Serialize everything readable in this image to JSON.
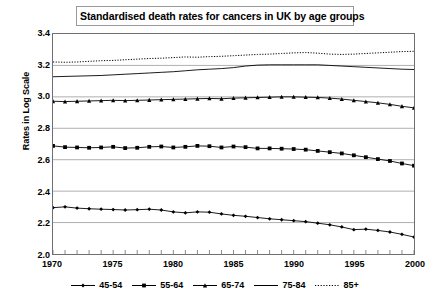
{
  "chart_data": {
    "type": "line",
    "title": "Standardised death rates for cancers in UK by age groups",
    "xlabel": "",
    "ylabel": "Rates in Log Scale",
    "xlim": [
      1970,
      2000
    ],
    "ylim": [
      2.0,
      3.4
    ],
    "yticks": [
      "2.0",
      "2.2",
      "2.4",
      "2.6",
      "2.8",
      "3.0",
      "3.2",
      "3.4"
    ],
    "xticks": [
      "1970",
      "1975",
      "1980",
      "1985",
      "1990",
      "1995",
      "2000"
    ],
    "x_minor_tick_step": 1,
    "grid": "horizontal",
    "legend_position": "bottom",
    "x": [
      1970,
      1971,
      1972,
      1973,
      1974,
      1975,
      1976,
      1977,
      1978,
      1979,
      1980,
      1981,
      1982,
      1983,
      1984,
      1985,
      1986,
      1987,
      1988,
      1989,
      1990,
      1991,
      1992,
      1993,
      1994,
      1995,
      1996,
      1997,
      1998,
      1999,
      2000
    ],
    "series": [
      {
        "name": "45-54",
        "color": "#000000",
        "marker": "diamond",
        "style": "solid",
        "values": [
          2.295,
          2.3,
          2.292,
          2.288,
          2.285,
          2.283,
          2.28,
          2.282,
          2.285,
          2.28,
          2.268,
          2.262,
          2.268,
          2.266,
          2.255,
          2.246,
          2.24,
          2.232,
          2.224,
          2.218,
          2.212,
          2.206,
          2.196,
          2.186,
          2.172,
          2.155,
          2.158,
          2.15,
          2.14,
          2.125,
          2.108
        ]
      },
      {
        "name": "55-64",
        "color": "#000000",
        "marker": "square",
        "style": "solid",
        "values": [
          2.688,
          2.68,
          2.678,
          2.676,
          2.678,
          2.682,
          2.674,
          2.676,
          2.682,
          2.684,
          2.678,
          2.682,
          2.688,
          2.686,
          2.678,
          2.684,
          2.68,
          2.672,
          2.672,
          2.67,
          2.668,
          2.664,
          2.656,
          2.648,
          2.64,
          2.628,
          2.616,
          2.604,
          2.592,
          2.576,
          2.562
        ]
      },
      {
        "name": "65-74",
        "color": "#000000",
        "marker": "triangle",
        "style": "solid",
        "values": [
          2.972,
          2.97,
          2.972,
          2.974,
          2.976,
          2.978,
          2.976,
          2.978,
          2.98,
          2.982,
          2.984,
          2.986,
          2.988,
          2.99,
          2.988,
          2.992,
          2.994,
          2.996,
          2.998,
          3.0,
          3.0,
          2.998,
          2.996,
          2.992,
          2.986,
          2.978,
          2.97,
          2.962,
          2.952,
          2.94,
          2.93
        ]
      },
      {
        "name": "75-84",
        "color": "#000000",
        "marker": "none",
        "style": "solid",
        "values": [
          3.128,
          3.13,
          3.132,
          3.134,
          3.136,
          3.14,
          3.144,
          3.148,
          3.152,
          3.156,
          3.16,
          3.166,
          3.172,
          3.176,
          3.18,
          3.186,
          3.196,
          3.202,
          3.204,
          3.204,
          3.204,
          3.204,
          3.204,
          3.2,
          3.196,
          3.192,
          3.188,
          3.184,
          3.18,
          3.176,
          3.174
        ]
      },
      {
        "name": "85+",
        "color": "#000000",
        "marker": "none",
        "style": "dotted",
        "values": [
          3.222,
          3.22,
          3.222,
          3.226,
          3.23,
          3.232,
          3.236,
          3.24,
          3.244,
          3.246,
          3.25,
          3.254,
          3.252,
          3.256,
          3.258,
          3.262,
          3.266,
          3.27,
          3.272,
          3.276,
          3.28,
          3.282,
          3.278,
          3.272,
          3.27,
          3.272,
          3.276,
          3.28,
          3.284,
          3.288,
          3.29
        ]
      }
    ]
  }
}
